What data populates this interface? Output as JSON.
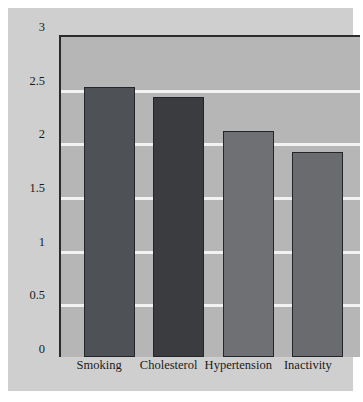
{
  "chart_data": {
    "type": "bar",
    "title": "",
    "subtitle": "",
    "xlabel": "",
    "ylabel": "",
    "categories": [
      "Smoking",
      "Cholesterol",
      "Hypertension",
      "Inactivity"
    ],
    "values": [
      2.52,
      2.42,
      2.11,
      1.91
    ],
    "series": [
      {
        "name": "Relative risk",
        "values": [
          2.52,
          2.42,
          2.11,
          1.91
        ]
      }
    ],
    "bar_colors": [
      "#4e5155",
      "#3a3c40",
      "#6e7073",
      "#696b6e"
    ],
    "ylim": [
      0,
      3
    ],
    "yticks": [
      0,
      0.5,
      1,
      1.5,
      2,
      2.5,
      3
    ],
    "ytick_labels": [
      "0",
      "0.5",
      "1",
      "1.5",
      "2",
      "2.5",
      "3"
    ],
    "grid": true,
    "grid_color": "#f2f2f2",
    "grid_axis": "y",
    "legend": false,
    "legend_position": "none",
    "plot_background": "#b6b6b6",
    "figure_background": "#cfcfcf",
    "axis_color": "#2b2b2b",
    "bar_edge_color": "#23252a"
  }
}
